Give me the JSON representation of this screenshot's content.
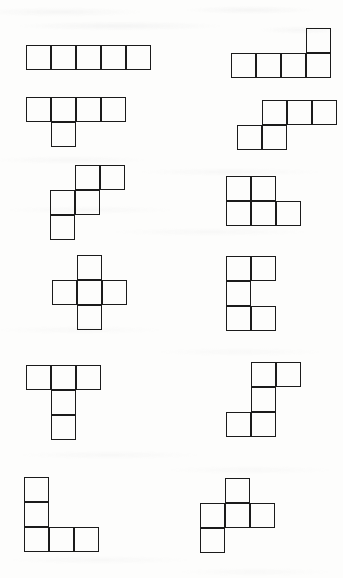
{
  "page": {
    "background_color": "#fdfdfc",
    "stroke_color": "#1b1b1b",
    "width": 343,
    "height": 578,
    "cell_size": 25,
    "text_content": ""
  },
  "diagram": {
    "type": "pentomino-set",
    "piece_count": 12,
    "columns": 2,
    "rows": 6,
    "pieces": [
      {
        "id": "piece-1",
        "name": "I-pentomino",
        "label": "",
        "x": 26,
        "y": 45,
        "cells": [
          [
            0,
            0
          ],
          [
            0,
            1
          ],
          [
            0,
            2
          ],
          [
            0,
            3
          ],
          [
            0,
            4
          ]
        ]
      },
      {
        "id": "piece-2",
        "name": "L-pentomino",
        "label": "",
        "x": 231,
        "y": 28,
        "cells": [
          [
            0,
            3
          ],
          [
            1,
            0
          ],
          [
            1,
            1
          ],
          [
            1,
            2
          ],
          [
            1,
            3
          ]
        ]
      },
      {
        "id": "piece-3",
        "name": "Y-pentomino",
        "label": "",
        "x": 26,
        "y": 97,
        "cells": [
          [
            0,
            0
          ],
          [
            0,
            1
          ],
          [
            0,
            2
          ],
          [
            0,
            3
          ],
          [
            1,
            1
          ]
        ]
      },
      {
        "id": "piece-4",
        "name": "N-pentomino",
        "label": "",
        "x": 237,
        "y": 100,
        "cells": [
          [
            0,
            1
          ],
          [
            0,
            2
          ],
          [
            0,
            3
          ],
          [
            1,
            0
          ],
          [
            1,
            1
          ]
        ]
      },
      {
        "id": "piece-5",
        "name": "W-pentomino",
        "label": "",
        "x": 50,
        "y": 165,
        "cells": [
          [
            0,
            1
          ],
          [
            0,
            2
          ],
          [
            1,
            0
          ],
          [
            1,
            1
          ],
          [
            2,
            0
          ]
        ]
      },
      {
        "id": "piece-6",
        "name": "P-pentomino",
        "label": "",
        "x": 226,
        "y": 176,
        "cells": [
          [
            0,
            0
          ],
          [
            0,
            1
          ],
          [
            1,
            0
          ],
          [
            1,
            1
          ],
          [
            1,
            2
          ]
        ]
      },
      {
        "id": "piece-7",
        "name": "X-pentomino",
        "label": "",
        "x": 52,
        "y": 255,
        "cells": [
          [
            0,
            1
          ],
          [
            1,
            0
          ],
          [
            1,
            1
          ],
          [
            1,
            2
          ],
          [
            2,
            1
          ]
        ]
      },
      {
        "id": "piece-8",
        "name": "U-pentomino",
        "label": "",
        "x": 226,
        "y": 256,
        "cells": [
          [
            0,
            0
          ],
          [
            0,
            1
          ],
          [
            1,
            0
          ],
          [
            2,
            0
          ],
          [
            2,
            1
          ]
        ]
      },
      {
        "id": "piece-9",
        "name": "T-pentomino",
        "label": "",
        "x": 26,
        "y": 365,
        "cells": [
          [
            0,
            0
          ],
          [
            0,
            1
          ],
          [
            0,
            2
          ],
          [
            1,
            1
          ],
          [
            2,
            1
          ]
        ]
      },
      {
        "id": "piece-10",
        "name": "Z-pentomino",
        "label": "",
        "x": 226,
        "y": 362,
        "cells": [
          [
            0,
            1
          ],
          [
            0,
            2
          ],
          [
            1,
            1
          ],
          [
            2,
            0
          ],
          [
            2,
            1
          ]
        ]
      },
      {
        "id": "piece-11",
        "name": "V-pentomino",
        "label": "",
        "x": 24,
        "y": 477,
        "cells": [
          [
            0,
            0
          ],
          [
            1,
            0
          ],
          [
            2,
            0
          ],
          [
            2,
            1
          ],
          [
            2,
            2
          ]
        ]
      },
      {
        "id": "piece-12",
        "name": "F-pentomino",
        "label": "",
        "x": 200,
        "y": 478,
        "cells": [
          [
            0,
            1
          ],
          [
            1,
            0
          ],
          [
            1,
            1
          ],
          [
            1,
            2
          ],
          [
            2,
            0
          ]
        ]
      }
    ]
  }
}
